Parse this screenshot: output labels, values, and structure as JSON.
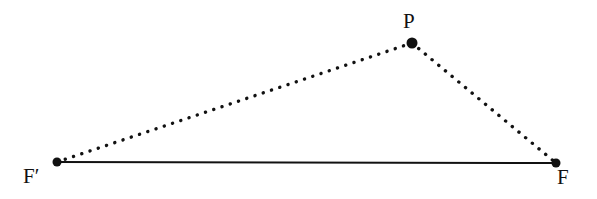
{
  "figure": {
    "type": "geometry-diagram",
    "width": 597,
    "height": 199,
    "background_color": "#ffffff",
    "stroke_color": "#111111"
  },
  "points": {
    "p": {
      "label": "P",
      "x": 412,
      "y": 43,
      "dot_radius": 5.5
    },
    "fp": {
      "label": "F′",
      "x": 57,
      "y": 162,
      "dot_radius": 4.5
    },
    "f": {
      "label": "F",
      "x": 556,
      "y": 163,
      "dot_radius": 4.5
    }
  },
  "segments": [
    {
      "name": "base-fprime-to-f",
      "from": "fp",
      "to": "f",
      "style": "solid",
      "width": 2
    },
    {
      "name": "leg-fprime-to-p",
      "from": "fp",
      "to": "p",
      "style": "dotted",
      "width": 3.4,
      "dot_gap": 8.6
    },
    {
      "name": "leg-p-to-f",
      "from": "p",
      "to": "f",
      "style": "dotted",
      "width": 3.4,
      "dot_gap": 8.6
    }
  ],
  "labels": {
    "p_label": "P",
    "fprime_label": "F′",
    "f_label": "F"
  }
}
